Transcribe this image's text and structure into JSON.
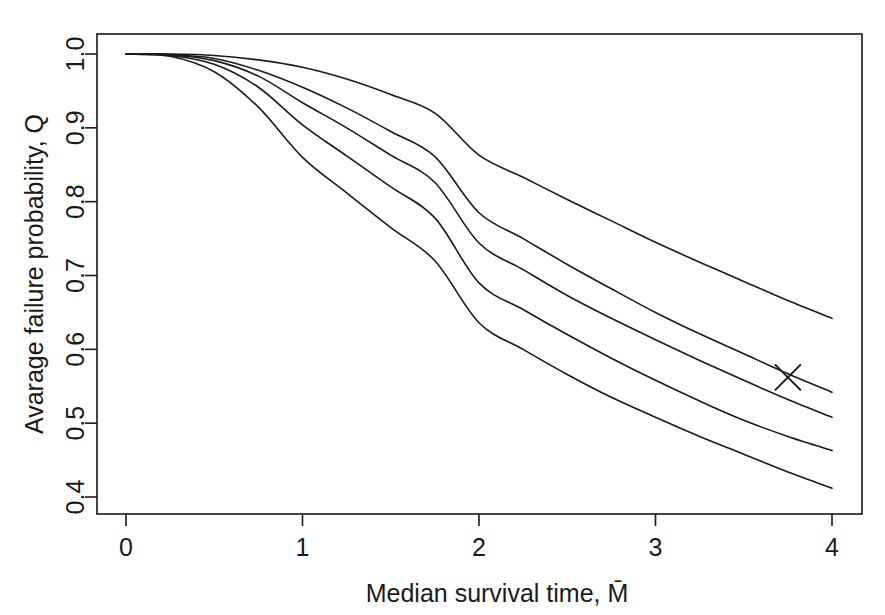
{
  "chart_data": {
    "type": "line",
    "title": "",
    "subtitle": "",
    "xlabel": "Median survival time, M̄",
    "xlabel_plain": "Median survival time, M",
    "ylabel": "Avarage failure probability, Q",
    "xlim": [
      0,
      4
    ],
    "ylim": [
      0.4,
      1.0
    ],
    "xticks": [
      0,
      1,
      2,
      3,
      4
    ],
    "xticklabels": [
      "0",
      "1",
      "2",
      "3",
      "4"
    ],
    "yticks": [
      0.4,
      0.5,
      0.6,
      0.7,
      0.8,
      0.9,
      1.0
    ],
    "yticklabels": [
      "0.4",
      "0.5",
      "0.6",
      "0.7",
      "0.8",
      "0.9",
      "1.0"
    ],
    "grid": false,
    "legend": "none",
    "frame": "box",
    "line_color": "#1a1a1a",
    "line_width": 1.6,
    "x": [
      0,
      0.25,
      0.5,
      0.75,
      1,
      1.25,
      1.5,
      1.75,
      2,
      2.25,
      2.5,
      2.75,
      3,
      3.25,
      3.5,
      3.75,
      4
    ],
    "series": [
      {
        "name": "curve-1",
        "values": [
          1.0,
          1.0,
          0.998,
          0.992,
          0.982,
          0.966,
          0.945,
          0.92,
          0.863,
          0.833,
          0.803,
          0.774,
          0.745,
          0.718,
          0.692,
          0.666,
          0.642
        ]
      },
      {
        "name": "curve-2",
        "values": [
          1.0,
          0.999,
          0.994,
          0.978,
          0.955,
          0.927,
          0.895,
          0.861,
          0.785,
          0.75,
          0.715,
          0.682,
          0.65,
          0.621,
          0.594,
          0.567,
          0.542
        ]
      },
      {
        "name": "curve-3",
        "values": [
          1.0,
          0.999,
          0.991,
          0.97,
          0.934,
          0.9,
          0.863,
          0.826,
          0.744,
          0.708,
          0.673,
          0.642,
          0.613,
          0.585,
          0.558,
          0.532,
          0.508
        ]
      },
      {
        "name": "curve-4",
        "values": [
          1.0,
          0.998,
          0.986,
          0.955,
          0.904,
          0.862,
          0.82,
          0.778,
          0.69,
          0.654,
          0.62,
          0.588,
          0.558,
          0.53,
          0.504,
          0.482,
          0.463
        ]
      },
      {
        "name": "curve-5",
        "values": [
          1.0,
          0.997,
          0.976,
          0.928,
          0.86,
          0.812,
          0.765,
          0.72,
          0.636,
          0.6,
          0.566,
          0.535,
          0.508,
          0.482,
          0.458,
          0.434,
          0.412
        ]
      }
    ],
    "annotations": [
      {
        "name": "cross-marker",
        "symbol": "x",
        "x": 3.75,
        "y": 0.562,
        "size": 13
      }
    ]
  }
}
